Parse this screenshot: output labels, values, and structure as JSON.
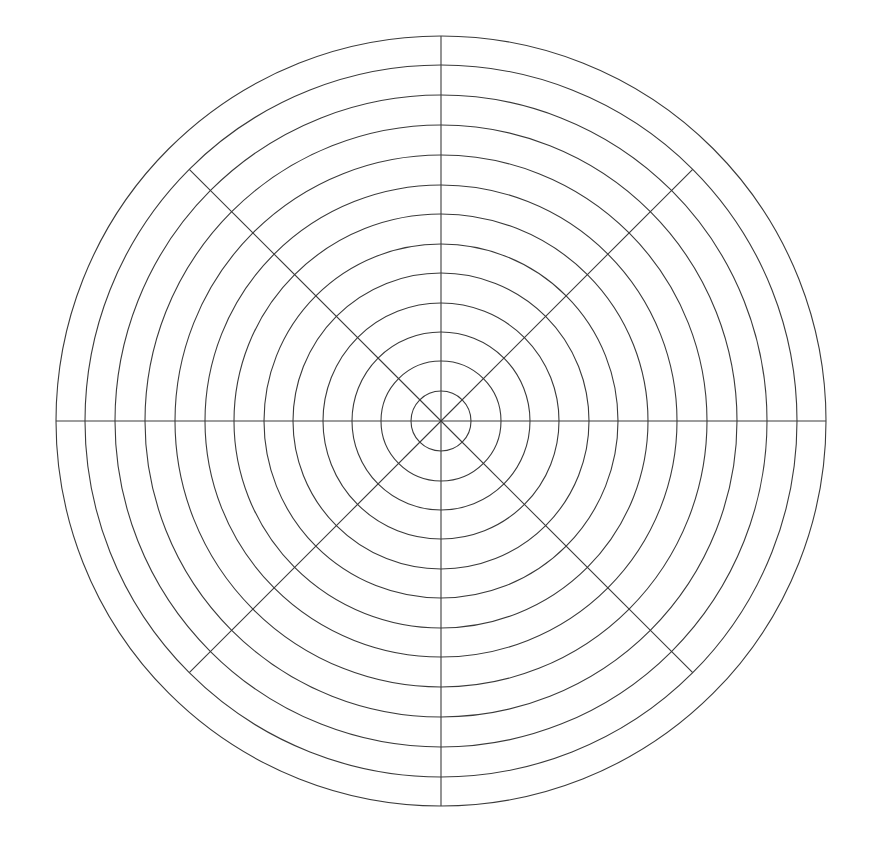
{
  "figure": {
    "name": "polar-grid",
    "title": "",
    "background_color": "#ffffff",
    "width": 872,
    "height": 846
  },
  "chart_data": {
    "type": "line",
    "title": "",
    "subtitle": "",
    "xlabel": "",
    "ylabel": "",
    "projection": "polar",
    "grid": true,
    "legend": null,
    "annotations": [],
    "center": {
      "x": 441,
      "y": 421
    },
    "radial_axis": {
      "label": "",
      "range": [
        0,
        12
      ],
      "tick_labels": [],
      "ring_count": 13,
      "ring_radii_px": [
        30,
        60,
        89,
        118,
        148,
        177,
        207,
        236,
        266,
        296,
        326,
        356,
        385
      ],
      "outer_radius_px": 385
    },
    "angular_axis": {
      "label": "",
      "tick_labels": [],
      "spoke_count": 8,
      "spoke_angles_deg": [
        0,
        45,
        90,
        135,
        180,
        225,
        270,
        315
      ],
      "cardinal_spoke_radius_px": 385,
      "diagonal_spoke_radius_px": 356
    },
    "series": [],
    "categories": [],
    "values": []
  },
  "style": {
    "line_color": "#3a3a3a",
    "line_width": 1.1,
    "background_color": "#ffffff"
  }
}
